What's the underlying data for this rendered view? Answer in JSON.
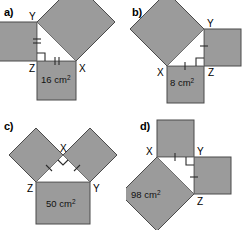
{
  "figure": {
    "colors": {
      "square_fill": "#9b9b9b",
      "square_stroke": "#4a4a4a",
      "triangle_fill": "#ffffff",
      "triangle_stroke": "#6e6e6e",
      "mark_stroke": "#2b2b2b",
      "text": "#000000",
      "background": "#ffffff"
    },
    "panels": [
      {
        "id": "a",
        "label": "a)",
        "area_label": "16 cm",
        "area_unit_exponent": "2",
        "area_value": 16,
        "area_on_side": "ZX",
        "right_angle_vertex": "Z",
        "vertices": [
          {
            "name": "Y",
            "x": 37,
            "y": 22
          },
          {
            "name": "Z",
            "x": 37,
            "y": 61
          },
          {
            "name": "X",
            "x": 76,
            "y": 61
          }
        ],
        "vertex_labels": [
          {
            "name": "Y",
            "x": 29,
            "y": 20
          },
          {
            "name": "Z",
            "x": 29,
            "y": 72
          },
          {
            "name": "X",
            "x": 79,
            "y": 72
          }
        ],
        "tick_counts": {
          "YZ": 2,
          "ZX": 2
        },
        "squares": [
          {
            "on_side": "YZ",
            "kind": "axis-aligned-left"
          },
          {
            "on_side": "ZX",
            "kind": "axis-aligned-below",
            "labeled": true
          },
          {
            "on_side": "YX",
            "kind": "rotated-hypotenuse"
          }
        ]
      },
      {
        "id": "b",
        "label": "b)",
        "area_label": "8 cm",
        "area_unit_exponent": "2",
        "area_value": 8,
        "area_on_side": "XZ",
        "right_angle_vertex": "Z",
        "vertices": [
          {
            "name": "Y",
            "x": 78,
            "y": 29
          },
          {
            "name": "Z",
            "x": 78,
            "y": 66
          },
          {
            "name": "X",
            "x": 41,
            "y": 66
          }
        ],
        "vertex_labels": [
          {
            "name": "Y",
            "x": 81,
            "y": 27
          },
          {
            "name": "Z",
            "x": 82,
            "y": 76
          },
          {
            "name": "X",
            "x": 31,
            "y": 76
          }
        ],
        "tick_counts": {
          "YZ": 1,
          "ZX": 1
        },
        "squares": [
          {
            "on_side": "YZ",
            "kind": "axis-aligned-right"
          },
          {
            "on_side": "XZ",
            "kind": "axis-aligned-below",
            "labeled": true
          },
          {
            "on_side": "YX",
            "kind": "rotated-hypotenuse"
          }
        ]
      },
      {
        "id": "c",
        "label": "c)",
        "area_label": "50 cm",
        "area_unit_exponent": "2",
        "area_value": 50,
        "area_on_side": "ZY",
        "right_angle_vertex": "X",
        "vertices": [
          {
            "name": "X",
            "x": 63,
            "y": 40
          },
          {
            "name": "Z",
            "x": 36,
            "y": 67
          },
          {
            "name": "Y",
            "x": 90,
            "y": 67
          }
        ],
        "vertex_labels": [
          {
            "name": "X",
            "x": 60,
            "y": 37
          },
          {
            "name": "Z",
            "x": 27,
            "y": 77
          },
          {
            "name": "Y",
            "x": 93,
            "y": 77
          }
        ],
        "tick_counts": {
          "XZ": 1,
          "XY": 1
        },
        "squares": [
          {
            "on_side": "XZ",
            "kind": "rotated-leg-left"
          },
          {
            "on_side": "XY",
            "kind": "rotated-leg-right"
          },
          {
            "on_side": "ZY",
            "kind": "axis-aligned-below",
            "labeled": true
          }
        ]
      },
      {
        "id": "d",
        "label": "d)",
        "area_label": "98 cm",
        "area_unit_exponent": "2",
        "area_value": 98,
        "area_on_side": "XZ",
        "right_angle_vertex": "Y",
        "vertices": [
          {
            "name": "X",
            "x": 31,
            "y": 42
          },
          {
            "name": "Y",
            "x": 68,
            "y": 42
          },
          {
            "name": "Z",
            "x": 68,
            "y": 79
          }
        ],
        "vertex_labels": [
          {
            "name": "X",
            "x": 21,
            "y": 40
          },
          {
            "name": "Y",
            "x": 71,
            "y": 40
          },
          {
            "name": "Z",
            "x": 71,
            "y": 90
          }
        ],
        "tick_counts": {
          "XY": 1,
          "YZ": 1
        },
        "squares": [
          {
            "on_side": "XY",
            "kind": "axis-aligned-above"
          },
          {
            "on_side": "YZ",
            "kind": "axis-aligned-right"
          },
          {
            "on_side": "XZ",
            "kind": "rotated-hypotenuse",
            "labeled": true
          }
        ]
      }
    ]
  }
}
